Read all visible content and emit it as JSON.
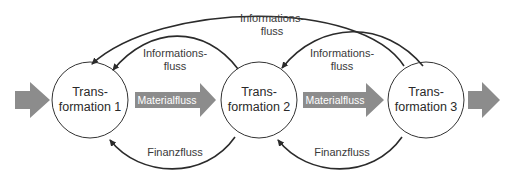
{
  "diagram": {
    "type": "flow-diagram",
    "colors": {
      "node_stroke": "#333333",
      "node_fill": "#ffffff",
      "flow_arrow": "#333333",
      "material_arrow": "#8c8c8c",
      "text": "#333333",
      "material_text": "#ffffff"
    },
    "nodes": [
      {
        "id": "t1",
        "line1": "Trans-",
        "line2": "formation 1"
      },
      {
        "id": "t2",
        "line1": "Trans-",
        "line2": "formation 2"
      },
      {
        "id": "t3",
        "line1": "Trans-",
        "line2": "formation 3"
      }
    ],
    "material_flows": [
      {
        "from": "input",
        "to": "t1",
        "label": ""
      },
      {
        "from": "t1",
        "to": "t2",
        "label": "Materialfluss"
      },
      {
        "from": "t2",
        "to": "t3",
        "label": "Materialfluss"
      },
      {
        "from": "t3",
        "to": "output",
        "label": ""
      }
    ],
    "information_flows": [
      {
        "from": "t3",
        "to": "t1",
        "line1": "Informations-",
        "line2": "fluss"
      },
      {
        "from": "t2",
        "to": "t1",
        "line1": "Informations-",
        "line2": "fluss"
      },
      {
        "from": "t3",
        "to": "t2",
        "line1": "Informations-",
        "line2": "fluss"
      }
    ],
    "financial_flows": [
      {
        "from": "t2",
        "to": "t1",
        "label": "Finanzfluss"
      },
      {
        "from": "t3",
        "to": "t2",
        "label": "Finanzfluss"
      }
    ]
  }
}
